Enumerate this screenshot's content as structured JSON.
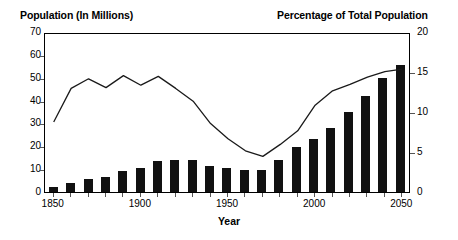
{
  "chart_data": {
    "type": "bar",
    "title": "",
    "xlabel": "Year",
    "ylabel": "Population (In Millions)",
    "y2label": "Percentage of Total Population",
    "ylim": [
      0,
      70
    ],
    "y2lim": [
      0,
      20
    ],
    "grid": false,
    "legend": "none",
    "categories": [
      "1850",
      "1860",
      "1870",
      "1880",
      "1890",
      "1900",
      "1910",
      "1920",
      "1930",
      "1940",
      "1950",
      "1960",
      "1970",
      "1980",
      "1990",
      "2000",
      "2010",
      "2020",
      "2030",
      "2040",
      "2050"
    ],
    "x_tick_labels": [
      "1850",
      "1900",
      "1950",
      "2000",
      "2050"
    ],
    "y_tick_labels": [
      "0",
      "10",
      "20",
      "30",
      "40",
      "50",
      "60",
      "70"
    ],
    "y2_tick_labels": [
      "0",
      "5",
      "10",
      "15",
      "20"
    ],
    "series": [
      {
        "name": "Population (In Millions)",
        "type": "bar",
        "axis": "left",
        "color": "#111111",
        "values": [
          2.2,
          4.1,
          5.6,
          6.7,
          9.2,
          10.3,
          13.5,
          13.9,
          14.2,
          11.6,
          10.3,
          9.7,
          9.6,
          14.1,
          19.8,
          23.1,
          28.0,
          35.0,
          42.1,
          50.0,
          55.5
        ]
      },
      {
        "name": "Percentage of Total Population",
        "type": "line",
        "axis": "right",
        "color": "#1a1a1a",
        "values": [
          9.0,
          13.2,
          14.4,
          13.3,
          14.8,
          13.6,
          14.7,
          13.2,
          11.6,
          8.8,
          6.9,
          5.4,
          4.7,
          6.2,
          7.9,
          11.1,
          12.9,
          13.7,
          14.6,
          15.3,
          15.6
        ]
      }
    ]
  },
  "axis_titles": {
    "left": "Population (In Millions)",
    "right": "Percentage of Total Population",
    "bottom": "Year"
  }
}
